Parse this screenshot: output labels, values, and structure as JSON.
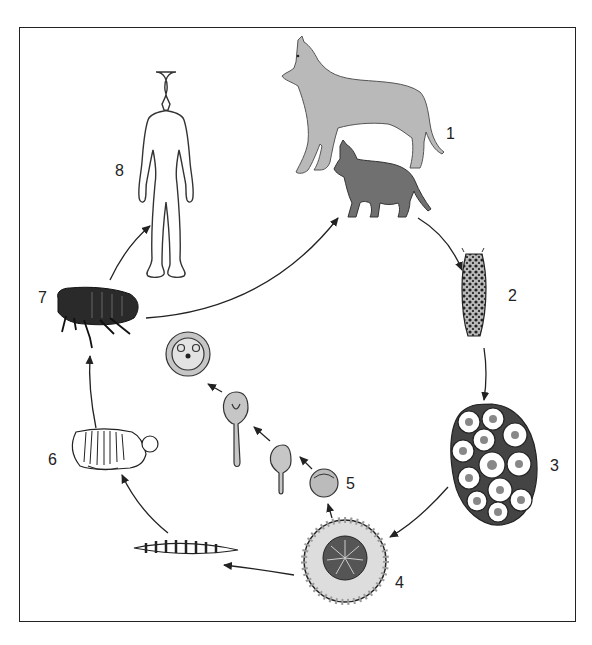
{
  "diagram": {
    "type": "life-cycle",
    "colors": {
      "frame": "#222222",
      "dog_fill": "#b9b9b9",
      "cat_fill": "#707070",
      "flea_fill": "#2a2a2a",
      "arrow": "#222222",
      "background": "#ffffff"
    },
    "stages": [
      {
        "id": "1",
        "label": "1",
        "depicts": "definitive hosts: dog and cat"
      },
      {
        "id": "2",
        "label": "2",
        "depicts": "gravid proglottid"
      },
      {
        "id": "3",
        "label": "3",
        "depicts": "egg packet"
      },
      {
        "id": "4",
        "label": "4",
        "depicts": "egg / oncosphere"
      },
      {
        "id": "5",
        "label": "5",
        "depicts": "developing cysticercoid in flea"
      },
      {
        "id": "6",
        "label": "6",
        "depicts": "flea pupa"
      },
      {
        "id": "7",
        "label": "7",
        "depicts": "adult flea"
      },
      {
        "id": "8",
        "label": "8",
        "depicts": "human (accidental host)"
      }
    ],
    "unlabeled": [
      {
        "depicts": "flea larva"
      },
      {
        "depicts": "cysticercoid development sequence"
      }
    ],
    "arrows": [
      {
        "from": "1",
        "to": "2"
      },
      {
        "from": "2",
        "to": "3"
      },
      {
        "from": "3",
        "to": "4"
      },
      {
        "from": "4",
        "to": "larva"
      },
      {
        "from": "larva",
        "to": "6"
      },
      {
        "from": "6",
        "to": "7"
      },
      {
        "from": "7",
        "to": "8"
      },
      {
        "from": "7",
        "to": "1"
      },
      {
        "from": "4",
        "to": "5"
      },
      {
        "from": "5",
        "to": "cysticercoid"
      }
    ]
  }
}
